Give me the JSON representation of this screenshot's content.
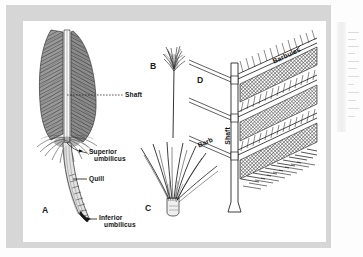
{
  "figure": {
    "panels": [
      {
        "id": "A",
        "letter": "A",
        "name": "contour-feather",
        "labels": [
          {
            "key": "shaft",
            "text": "Shaft"
          },
          {
            "key": "superior_umbilicus_l1",
            "text": "Superior"
          },
          {
            "key": "superior_umbilicus_l2",
            "text": "umbilicus"
          },
          {
            "key": "quill",
            "text": "Quill"
          },
          {
            "key": "inferior_umbilicus_l1",
            "text": "Inferior"
          },
          {
            "key": "inferior_umbilicus_l2",
            "text": "umbilicus"
          }
        ]
      },
      {
        "id": "B",
        "letter": "B",
        "name": "filoplume",
        "labels": []
      },
      {
        "id": "C",
        "letter": "C",
        "name": "down-feather",
        "labels": []
      },
      {
        "id": "D",
        "letter": "D",
        "name": "barb-barbule-detail",
        "labels": [
          {
            "key": "barbules",
            "text": "Barbules"
          },
          {
            "key": "barb",
            "text": "Barb"
          },
          {
            "key": "shaft",
            "text": "Shaft"
          }
        ]
      }
    ],
    "letters": {
      "a": "A",
      "b": "B",
      "c": "C",
      "d": "D"
    },
    "callouts": {
      "shaft": "Shaft",
      "superior_umbilicus_line1": "Superior",
      "superior_umbilicus_line2": "umbilicus",
      "quill": "Quill",
      "inferior_umbilicus_line1": "Inferior",
      "inferior_umbilicus_line2": "umbilicus",
      "barbules": "Barbules",
      "barb": "Barb",
      "shaft_d": "Shaft"
    },
    "colors": {
      "mat": "#d6d6d6",
      "plate_bg": "#ffffff",
      "ink": "#141414",
      "vane_dark": "#6a6a6a",
      "vane_mid": "#8f8f8f",
      "page": "#fdfdfd"
    }
  }
}
